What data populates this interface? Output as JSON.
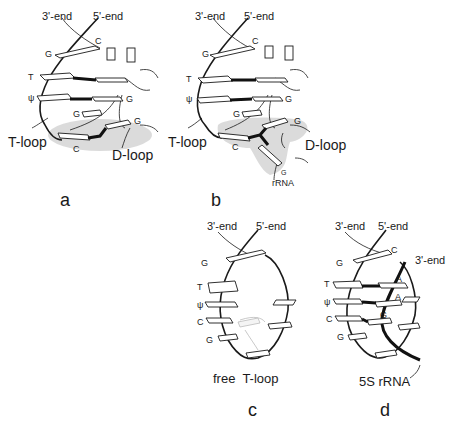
{
  "figure": {
    "panels": [
      {
        "id": "a",
        "panel_label": "a",
        "end_labels": {
          "three_prime": "3'-end",
          "five_prime": "5'-end"
        },
        "base_labels": {
          "g_top": "G",
          "c_top": "C",
          "t": "T",
          "psi": "ψ",
          "g_right": "G",
          "g_mid": "G",
          "g_dloop": "G",
          "c_bottom": "C"
        },
        "loop_labels": {
          "t_loop": "T-loop",
          "d_loop": "D-loop"
        }
      },
      {
        "id": "b",
        "panel_label": "b",
        "end_labels": {
          "three_prime": "3'-end",
          "five_prime": "5'-end"
        },
        "base_labels": {
          "g_top": "G",
          "c_top": "C",
          "t": "T",
          "psi": "ψ",
          "g_right": "G",
          "g_mid": "G",
          "g_dloop": "G",
          "c_bottom": "C",
          "g_rrna": "G"
        },
        "loop_labels": {
          "t_loop": "T-loop",
          "d_loop": "D-loop",
          "rrna": "rRNA"
        }
      },
      {
        "id": "c",
        "panel_label": "c",
        "end_labels": {
          "three_prime": "3'-end",
          "five_prime": "5'-end"
        },
        "base_labels": {
          "g_top": "G",
          "t": "T",
          "psi": "ψ",
          "c": "C",
          "g_bottom": "G"
        },
        "caption": "free  T-loop"
      },
      {
        "id": "d",
        "panel_label": "d",
        "end_labels": {
          "three_prime": "3'-end",
          "five_prime": "5'-end",
          "rrna_three_prime": "3'-end"
        },
        "base_labels": {
          "g_top": "G",
          "c_top": "C",
          "t": "T",
          "psi": "ψ",
          "c": "C",
          "g_bottom": "G",
          "a1": "A",
          "a2": "A",
          "g_right": "G"
        },
        "loop_labels": {
          "rrna": "5S rRNA"
        }
      }
    ]
  }
}
